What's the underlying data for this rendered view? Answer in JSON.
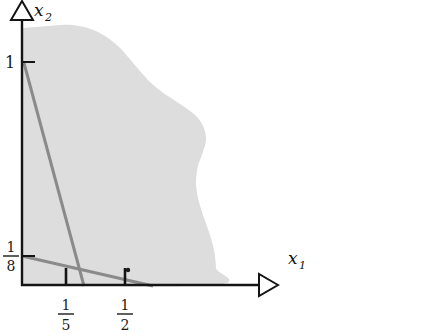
{
  "figure": {
    "kind": "feasible-region-plot",
    "background_color": "#ffffff",
    "axis_color": "#141414",
    "region_fill": "#dddddd",
    "constraint_line_color": "#8a8a8a",
    "point_color": "#1a1a1a"
  },
  "axes": {
    "x": {
      "label_base": "x",
      "label_sub": "1",
      "arrow": "triangle-right-icon",
      "origin_px": [
        22,
        285
      ],
      "end_px": [
        278,
        285
      ]
    },
    "y": {
      "label_base": "x",
      "label_sub": "2",
      "arrow": "triangle-up-icon",
      "origin_px": [
        22,
        285
      ],
      "end_px": [
        22,
        12
      ]
    }
  },
  "ticks": {
    "y": [
      {
        "text": "1",
        "kind": "integer",
        "value": 1,
        "y_px": 62
      },
      {
        "text": "1/8",
        "kind": "fraction",
        "numerator": "1",
        "denominator": "8",
        "value": 0.125,
        "y_px": 256
      }
    ],
    "x": [
      {
        "text": "1/5",
        "kind": "fraction",
        "numerator": "1",
        "denominator": "5",
        "value": 0.2,
        "x_px": 66
      },
      {
        "text": "1/2",
        "kind": "fraction",
        "numerator": "1",
        "denominator": "2",
        "value": 0.5,
        "x_px": 125
      }
    ]
  },
  "chart_data": {
    "type": "area",
    "title": "",
    "xlabel": "x_1",
    "ylabel": "x_2",
    "grid": false,
    "legend": "none",
    "shaded_region": {
      "name": "feasible-region",
      "fill": "#dddddd",
      "description": "blob-shaped shaded set bounded left by the x2 axis and below by the x1 axis",
      "boundary_px": [
        [
          22,
          285
        ],
        [
          215,
          285
        ],
        [
          216,
          268
        ],
        [
          214,
          250
        ],
        [
          209,
          232
        ],
        [
          203,
          215
        ],
        [
          198,
          198
        ],
        [
          196,
          182
        ],
        [
          198,
          166
        ],
        [
          203,
          152
        ],
        [
          206,
          140
        ],
        [
          204,
          128
        ],
        [
          197,
          117
        ],
        [
          186,
          108
        ],
        [
          174,
          100
        ],
        [
          162,
          92
        ],
        [
          150,
          82
        ],
        [
          139,
          70
        ],
        [
          129,
          58
        ],
        [
          119,
          47
        ],
        [
          108,
          38
        ],
        [
          96,
          31
        ],
        [
          84,
          27
        ],
        [
          72,
          25
        ],
        [
          60,
          25
        ],
        [
          48,
          26
        ],
        [
          36,
          27
        ],
        [
          22,
          28
        ]
      ]
    },
    "constraint_lines": [
      {
        "name": "steep-constraint-line",
        "color": "#8a8a8a",
        "width_px": 3,
        "from_px": [
          24,
          63
        ],
        "to_px": [
          84,
          286
        ],
        "intercepts": {
          "x2_at_x1_0": 1,
          "x1_at_x2_0": 0.26
        }
      },
      {
        "name": "shallow-constraint-line",
        "color": "#8a8a8a",
        "width_px": 3,
        "from_px": [
          22,
          256
        ],
        "to_px": [
          153,
          286
        ],
        "intercepts": {
          "x2_at_x1_0": 0.125,
          "x1_at_x2_0": 0.5
        }
      }
    ],
    "points": [
      {
        "name": "marked-point",
        "px": [
          128,
          270
        ],
        "r_px": 2.2,
        "color": "#1a1a1a"
      }
    ]
  }
}
